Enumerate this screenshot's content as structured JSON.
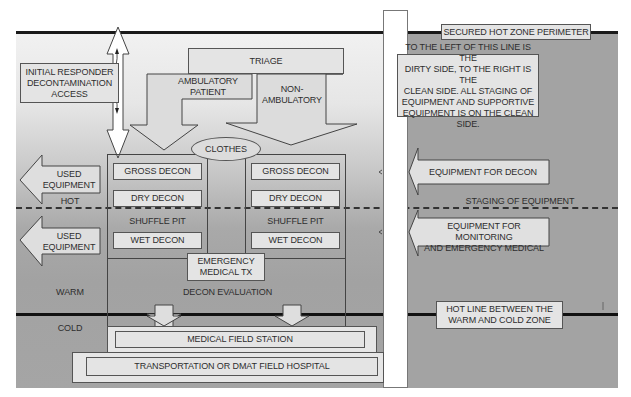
{
  "diagram": {
    "perimeter_label": "SECURED HOT ZONE PERIMETER",
    "clean_dirty_note": [
      "TO THE LEFT OF THIS LINE IS THE",
      "DIRTY SIDE, TO THE RIGHT IS THE",
      "CLEAN SIDE. ALL STAGING OF",
      "EQUIPMENT AND SUPPORTIVE",
      "EQUIPMENT IS ON THE CLEAN SIDE."
    ],
    "initial_responder": [
      "INITIAL RESPONDER",
      "DECONTAMINATION",
      "ACCESS"
    ],
    "triage": "TRIAGE",
    "ambulatory": [
      "AMBULATORY",
      "PATIENT"
    ],
    "non_ambulatory": [
      "NON-",
      "AMBULATORY"
    ],
    "clothes": "CLOTHES",
    "used_equipment_1": [
      "USED",
      "EQUIPMENT"
    ],
    "used_equipment_2": [
      "USED",
      "EQUIPMENT"
    ],
    "zones": {
      "hot": "HOT",
      "warm": "WARM",
      "cold": "COLD"
    },
    "left_line": {
      "gross": "GROSS DECON",
      "dry": "DRY DECON",
      "shuffle": "SHUFFLE PIT",
      "wet": "WET DECON"
    },
    "right_line": {
      "gross": "GROSS DECON",
      "dry": "DRY DECON",
      "shuffle": "SHUFFLE PIT",
      "wet": "WET DECON"
    },
    "emergency_tx": [
      "EMERGENCY",
      "MEDICAL TX"
    ],
    "decon_evaluation": "DECON EVALUATION",
    "equipment_for_decon": "EQUIPMENT FOR DECON",
    "staging": "STAGING OF EQUIPMENT",
    "equipment_monitoring": [
      "EQUIPMENT FOR MONITORING",
      "AND EMERGENCY MEDICAL"
    ],
    "hot_line_label": [
      "HOT LINE BETWEEN THE",
      "WARM AND COLD ZONE"
    ],
    "medical_field_station": "MEDICAL FIELD STATION",
    "transport": "TRANSPORTATION OR DMAT FIELD HOSPITAL"
  },
  "colors": {
    "box_fill": "#e4e4e4",
    "right_zone": "#a3a3a3",
    "line": "#1a1a1a",
    "text": "#2e2e2e"
  }
}
